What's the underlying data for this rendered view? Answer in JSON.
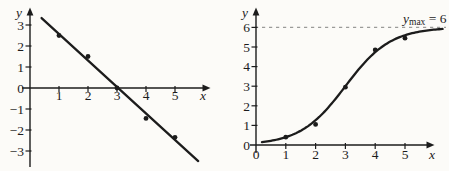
{
  "page": {
    "background": "#fcfbf8",
    "ink": "#1c1c1c",
    "accent_dash": "#9b9b99"
  },
  "chart_data": [
    {
      "id": "linear-fit",
      "type": "scatter",
      "title": "",
      "xlabel": "x",
      "ylabel": "y",
      "xlim": [
        0,
        6.2
      ],
      "ylim": [
        -3.9,
        3.9
      ],
      "grid": false,
      "legend": null,
      "x_tick_values": [
        1,
        2,
        3,
        4,
        5
      ],
      "x_tick_labels": [
        "1",
        "2",
        "3",
        "4",
        "5"
      ],
      "y_tick_values": [
        3,
        2,
        1,
        0,
        -1,
        -2,
        -3
      ],
      "y_tick_labels": [
        "3",
        "2",
        "1",
        "0",
        "−1",
        "−2",
        "−3"
      ],
      "points": [
        [
          1,
          2.5
        ],
        [
          2,
          1.5
        ],
        [
          3,
          0
        ],
        [
          4,
          -1.45
        ],
        [
          5,
          -2.35
        ]
      ],
      "fit_line": {
        "x1": 0.4,
        "y1": 3.33,
        "x2": 5.8,
        "y2": -3.48,
        "slope": -1.26,
        "x_intercept": 3
      }
    },
    {
      "id": "logistic-growth",
      "type": "scatter",
      "title": "",
      "xlabel": "x",
      "ylabel": "y",
      "xlim": [
        0,
        6.3
      ],
      "ylim": [
        0,
        7
      ],
      "grid": false,
      "legend": null,
      "x_tick_values": [
        0,
        1,
        2,
        3,
        4,
        5
      ],
      "x_tick_labels": [
        "0",
        "1",
        "2",
        "3",
        "4",
        "5"
      ],
      "y_tick_values": [
        0,
        1,
        2,
        3,
        4,
        5,
        6
      ],
      "y_tick_labels": [
        "0",
        "1",
        "2",
        "3",
        "4",
        "5",
        "6"
      ],
      "points": [
        [
          1,
          0.4
        ],
        [
          2,
          1.05
        ],
        [
          3,
          2.95
        ],
        [
          4,
          4.85
        ],
        [
          5,
          5.45
        ]
      ],
      "curve": {
        "form": "logistic",
        "ymax": 6,
        "k": 1.32,
        "midpoint": 3,
        "x_start": 0.2,
        "x_end": 6.28
      },
      "asymptote": {
        "y": 6,
        "label_text": "ymax = 6",
        "label_variable": "y",
        "label_subscript": "max",
        "label_rest": " = 6",
        "line_color": "#9b9b99"
      }
    }
  ]
}
